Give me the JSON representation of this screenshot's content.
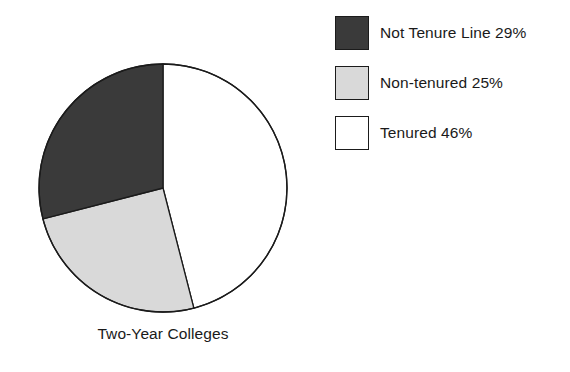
{
  "chart_data": {
    "type": "pie",
    "title": "",
    "caption": "Two-Year Colleges",
    "categories": [
      "Not Tenure Line",
      "Non-tenured",
      "Tenured"
    ],
    "values": [
      29,
      25,
      46
    ],
    "value_unit": "%",
    "labels": [
      "Not Tenure Line 29%",
      "Non-tenured 25%",
      "Tenured 46%"
    ],
    "colors": [
      "#3a3a3a",
      "#d9d9d9",
      "#ffffff"
    ],
    "start_angle_deg": 0,
    "direction": "clockwise",
    "slice_order_from_top_clockwise": [
      "Tenured",
      "Non-tenured",
      "Not Tenure Line"
    ],
    "slice_angles_deg": [
      104.4,
      90.0,
      165.6
    ],
    "legend_position": "right",
    "grid": false,
    "outline_color": "#1b1b1b"
  },
  "pie": {
    "center_x": 163,
    "center_y": 188,
    "radius": 124,
    "caption": "Two-Year Colleges",
    "slices": [
      {
        "name": "Tenured",
        "label": "Tenured 46%",
        "percent": 46,
        "color": "#ffffff",
        "start_deg": 0,
        "end_deg": 165.6
      },
      {
        "name": "Non-tenured",
        "label": "Non-tenured 25%",
        "percent": 25,
        "color": "#d9d9d9",
        "start_deg": 165.6,
        "end_deg": 255.6
      },
      {
        "name": "Not Tenure Line",
        "label": "Not Tenure Line 29%",
        "percent": 29,
        "color": "#3a3a3a",
        "start_deg": 255.6,
        "end_deg": 360
      }
    ]
  },
  "legend": {
    "items": [
      {
        "label": "Not Tenure Line 29%",
        "color": "#3a3a3a",
        "name": "not-tenure-line"
      },
      {
        "label": "Non-tenured 25%",
        "color": "#d9d9d9",
        "name": "non-tenured"
      },
      {
        "label": "Tenured 46%",
        "color": "#ffffff",
        "name": "tenured"
      }
    ]
  }
}
